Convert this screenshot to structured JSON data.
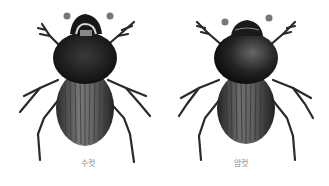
{
  "illustration": {
    "subject": "dung beetle",
    "style": "grayscale scientific illustration",
    "background_color": "#ffffff",
    "ink_color": "#1e1e1e",
    "figures": [
      {
        "id": "male",
        "caption": "수컷",
        "feature": "head horn / cephalic process"
      },
      {
        "id": "female",
        "caption": "암컷",
        "feature": "smooth rounded pronotum"
      }
    ]
  }
}
